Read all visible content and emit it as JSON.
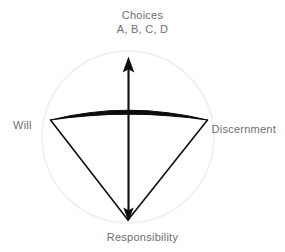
{
  "diagram": {
    "title_top": "Choices",
    "subtitle_top": "A, B, C, D",
    "label_left": "Will",
    "label_right": "Discernment",
    "label_bottom": "Responsibility",
    "colors": {
      "background": "#ffffff",
      "text": "#6e6e6e",
      "stroke_dark": "#0d0d0d",
      "circle_outline": "#f1f1f1"
    },
    "geometry": {
      "circle_center_x": 128,
      "circle_center_y": 137,
      "circle_radius": 86,
      "arc_left_x": 50,
      "arc_left_y": 120,
      "arc_right_x": 208,
      "arc_right_y": 120,
      "arc_apex_y": 110,
      "apex_x": 128,
      "apex_y": 220,
      "arrow_top_y": 57
    },
    "elements": {
      "circle_name": "boundary-circle",
      "arc_name": "thick-arc",
      "left_edge_name": "left-cone-edge",
      "right_edge_name": "right-cone-edge",
      "axis_name": "vertical-double-arrow"
    }
  }
}
